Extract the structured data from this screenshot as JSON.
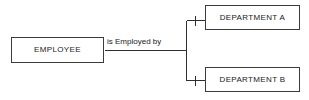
{
  "diagram": {
    "type": "entity-relationship",
    "background_color": "#ffffff",
    "line_color": "#2e2e2e",
    "border_color": "#3b3b3b",
    "text_color": "#1a1a1a",
    "entities": [
      {
        "id": "employee",
        "label": "EMPLOYEE"
      },
      {
        "id": "department_a",
        "label": "DEPARTMENT A"
      },
      {
        "id": "department_b",
        "label": "DEPARTMENT B"
      }
    ],
    "relationship": {
      "label": "is Employed by",
      "from": "employee",
      "to": [
        "department_a",
        "department_b"
      ],
      "cardinality_marker": "one"
    }
  }
}
